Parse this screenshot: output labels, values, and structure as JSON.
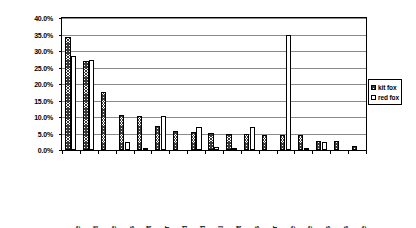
{
  "chart_data": {
    "type": "bar",
    "title": "",
    "xlabel": "",
    "ylabel": "",
    "ylim": [
      0,
      40
    ],
    "grid": true,
    "legend_position": "right",
    "y_tick_labels": [
      "0.0%",
      "5.0%",
      "10.0%",
      "15.0%",
      "20.0%",
      "25.0%",
      "30.0%",
      "35.0%",
      "40.0%"
    ],
    "y_ticks": [
      0,
      5,
      10,
      15,
      20,
      25,
      30,
      35,
      40
    ],
    "categories": [
      "house mice",
      "unk murid",
      "deer mice",
      "other arthropods",
      "field cricket",
      "pocket gopher",
      "leporid",
      "human derived",
      "unk mammal",
      "unk rodent",
      "ants",
      "grasshopper",
      "California vole",
      "harvest mice",
      "beetles",
      "birds",
      "pocket mice"
    ],
    "series": [
      {
        "name": "kit fox",
        "values": [
          34.3,
          27.0,
          17.6,
          10.6,
          10.4,
          7.2,
          5.9,
          5.6,
          5.3,
          4.9,
          4.8,
          4.7,
          4.5,
          4.4,
          2.8,
          2.6,
          1.3
        ]
      },
      {
        "name": "red fox",
        "values": [
          28.5,
          27.2,
          0.0,
          2.5,
          0.6,
          10.3,
          0.0,
          7.0,
          1.0,
          0.5,
          6.9,
          0.0,
          35.0,
          0.5,
          2.5,
          0.0,
          0.0
        ]
      }
    ]
  },
  "legend": {
    "items": [
      {
        "label": "kit fox",
        "swatch": "hatched"
      },
      {
        "label": "red fox",
        "swatch": "white"
      }
    ]
  }
}
